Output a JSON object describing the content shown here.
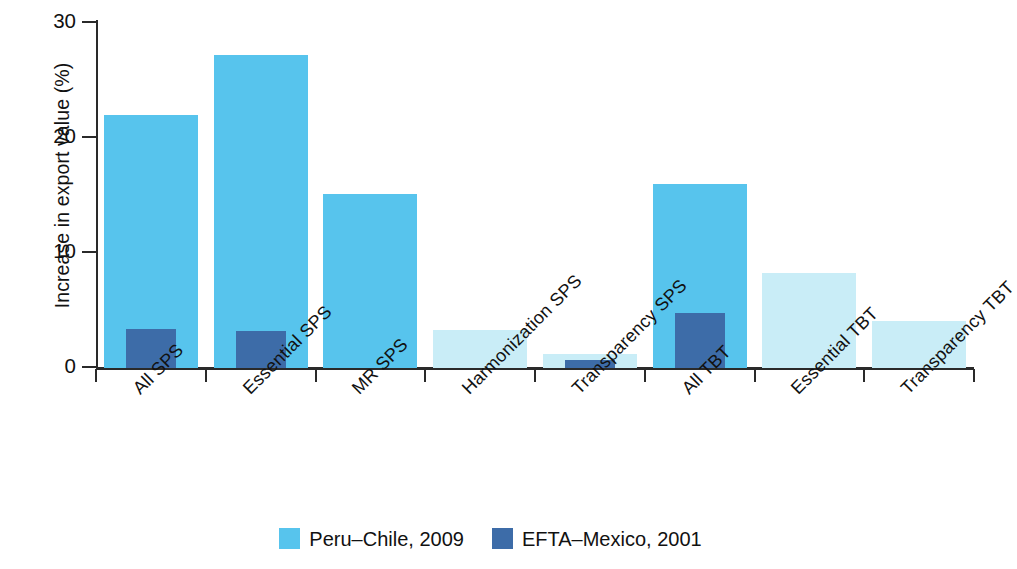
{
  "chart_data": {
    "type": "bar",
    "title": "",
    "xlabel": "",
    "ylabel": "Increase in export value (%)",
    "ylim": [
      0,
      30
    ],
    "yticks": [
      0,
      10,
      20,
      30
    ],
    "ytick_labels": [
      "0",
      "10",
      "20",
      "30"
    ],
    "grid": false,
    "legend_position": "bottom-center",
    "categories": [
      "All SPS",
      "Essential SPS",
      "MR SPS",
      "Harmonization SPS",
      "Transparency SPS",
      "All TBT",
      "Essential TBT",
      "Transparency TBT"
    ],
    "series": [
      {
        "name": "Peru–Chile, 2009",
        "color": "#57c4ed",
        "values": [
          22.0,
          27.2,
          15.1,
          3.3,
          1.2,
          16.0,
          8.3,
          4.1
        ],
        "bar_shades": [
          "#57c4ed",
          "#57c4ed",
          "#57c4ed",
          "#c9edf7",
          "#c9edf7",
          "#57c4ed",
          "#c9edf7",
          "#c9edf7"
        ]
      },
      {
        "name": "EFTA–Mexico, 2001",
        "color": "#3d6ca8",
        "values": [
          3.4,
          3.2,
          0,
          0,
          0.7,
          4.8,
          0,
          0
        ]
      }
    ]
  },
  "legend": {
    "items": [
      {
        "label": "Peru–Chile, 2009",
        "color": "#57c4ed"
      },
      {
        "label": "EFTA–Mexico, 2001",
        "color": "#3d6ca8"
      }
    ]
  }
}
